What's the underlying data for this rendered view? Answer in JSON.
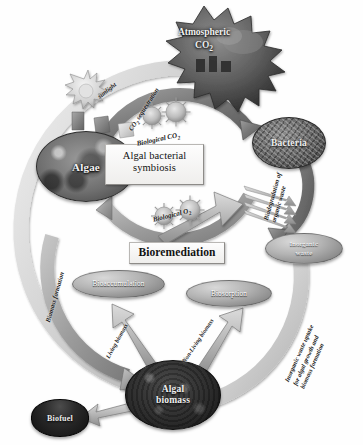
{
  "figure": {
    "palette": {
      "background": "#ffffff",
      "arc_dark": "#6f6f6f",
      "arc_mid": "#9a9a9a",
      "arc_light": "#c9c9c9",
      "arrow_fill": "#b3b3b3",
      "arrow_stroke": "#6a6a6a",
      "text_dark": "#1c1c1c",
      "text_light": "#f2f2f2",
      "box_fill": "#f2f1ef",
      "box_border": "#b9b7b4"
    }
  },
  "nodes": {
    "atmospheric_co2": {
      "label_line1": "Atmospheric",
      "label_line2": "CO",
      "label_sub": "2",
      "shape": "starburst"
    },
    "algae": {
      "label": "Algae",
      "shape": "oval-photo"
    },
    "bacteria": {
      "label": "Bacteria",
      "shape": "oval-photo"
    },
    "algal_biomass": {
      "label_line1": "Algal",
      "label_line2": "biomass",
      "shape": "oval-photo"
    },
    "biofuel": {
      "label": "Biofuel",
      "shape": "disc"
    },
    "inorganic_waste": {
      "label_line1": "Inorganic",
      "label_line2": "waste",
      "shape": "oval-flat"
    },
    "bioaccumulation": {
      "label": "Bioaccumulation",
      "shape": "oval-flat"
    },
    "biosorption": {
      "label": "Biosorption",
      "shape": "oval-flat"
    }
  },
  "boxes": {
    "symbiosis": {
      "line1": "Algal bacterial",
      "line2": "symbiosis"
    },
    "bioremediation": {
      "label": "Bioremediation"
    }
  },
  "flow_labels": {
    "sunlight": "sunlight",
    "co2_sequestration_pre": "CO",
    "co2_sequestration_sub": "2",
    "co2_sequestration_post": " sequestration",
    "biological_co2_pre": "Biological CO",
    "biological_co2_sub": "2",
    "biological_o2_pre": "Biological O",
    "biological_o2_sub": "2",
    "biodegradation_line1": "Biodegradation of",
    "biodegradation_line2": "organic waste",
    "biomass_formation": "Biomass formation",
    "living_biomass": "Living biomass",
    "non_living_biomass": "Non-Living biomass",
    "inorganic_uptake_line1": "Inorganic waste uptake",
    "inorganic_uptake_line2": "for algal growth and",
    "inorganic_uptake_line3": "biomass formation"
  }
}
